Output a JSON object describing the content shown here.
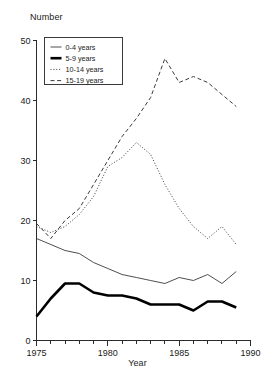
{
  "chart_data": {
    "type": "line",
    "title": "",
    "xlabel": "Year",
    "ylabel": "Number",
    "xlim": [
      1975,
      1990
    ],
    "ylim": [
      0,
      50
    ],
    "grid": false,
    "legend_position": "top-left",
    "x": [
      1975,
      1976,
      1977,
      1978,
      1979,
      1980,
      1981,
      1982,
      1983,
      1984,
      1985,
      1986,
      1987,
      1988,
      1989
    ],
    "xticks": [
      1975,
      1980,
      1985,
      1990
    ],
    "xtick_labels": [
      "1975",
      "1980",
      "1985",
      "1990"
    ],
    "xminor_ticks": [
      1976,
      1977,
      1978,
      1979,
      1981,
      1982,
      1983,
      1984,
      1986,
      1987,
      1988,
      1989
    ],
    "yticks": [
      0,
      10,
      20,
      30,
      40,
      50
    ],
    "ytick_labels": [
      "0",
      "10",
      "20",
      "30",
      "40",
      "50"
    ],
    "series": [
      {
        "name": "0-4 years",
        "style": "solid-thin",
        "color": "#3a3a3a",
        "width": 0.9,
        "values": [
          17,
          16,
          15,
          14.5,
          13,
          12,
          11,
          10.5,
          10,
          9.5,
          10.5,
          10,
          11,
          9.5,
          11.5
        ]
      },
      {
        "name": "5-9 years",
        "style": "solid-thick",
        "color": "#000000",
        "width": 2.6,
        "values": [
          4,
          7,
          9.5,
          9.5,
          8,
          7.5,
          7.5,
          7,
          6,
          6,
          6,
          5,
          6.5,
          6.5,
          5.5
        ]
      },
      {
        "name": "10-14 years",
        "style": "dotted",
        "color": "#3a3a3a",
        "width": 1,
        "values": [
          19,
          18,
          19,
          21,
          24,
          29,
          30.5,
          33,
          31,
          26,
          22,
          19,
          17,
          19,
          16
        ]
      },
      {
        "name": "15-19 years",
        "style": "dashed",
        "color": "#3a3a3a",
        "width": 1,
        "values": [
          19.5,
          17,
          20,
          22,
          26,
          30,
          34,
          37,
          40.5,
          47,
          43,
          44,
          43,
          41,
          39
        ]
      }
    ]
  },
  "legend": {
    "items": [
      {
        "label": "0-4 years"
      },
      {
        "label": "5-9 years"
      },
      {
        "label": "10-14 years"
      },
      {
        "label": "15-19 years"
      }
    ]
  }
}
